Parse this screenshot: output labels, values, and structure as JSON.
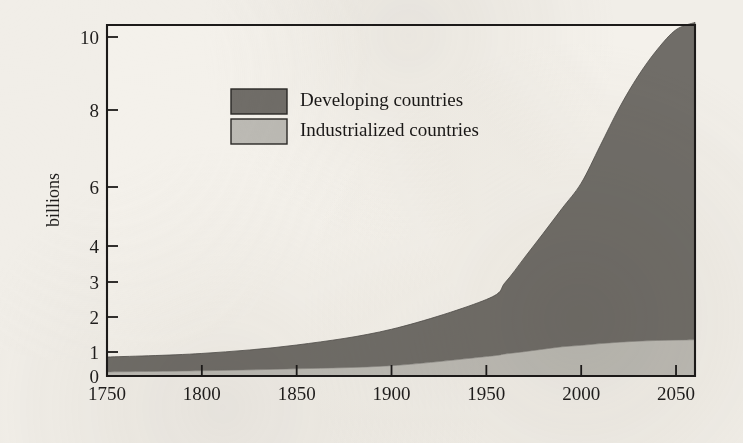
{
  "figure": {
    "background_color": "#f1eee8",
    "ink_color": "#1c1a19"
  },
  "axes": {
    "y_title": "billions",
    "y_tick_labels": [
      "0",
      "1",
      "2",
      "3",
      "4",
      "6",
      "8",
      "10"
    ],
    "x_tick_labels": [
      "1750",
      "1800",
      "1850",
      "1900",
      "1950",
      "2000",
      "2050"
    ]
  },
  "legend": {
    "entries": [
      {
        "label": "Developing countries",
        "color": "#706d68",
        "swatch_name": "legend-swatch-developing"
      },
      {
        "label": "Industrialized countries",
        "color": "#bcbab4",
        "swatch_name": "legend-swatch-industrialized"
      }
    ]
  },
  "chart_data": {
    "type": "area",
    "title": "",
    "subtitle": "",
    "xlabel": "",
    "ylabel": "billions",
    "stacked": true,
    "grid": false,
    "legend_position": "inside-upper-left",
    "xlim": [
      1750,
      2060
    ],
    "ylim": [
      0,
      10.6
    ],
    "y_axis_scale": "piecewise-linear (compressed above 4)",
    "y_ticks": [
      0,
      1,
      2,
      3,
      4,
      6,
      8,
      10
    ],
    "x_ticks": [
      1750,
      1800,
      1850,
      1900,
      1950,
      2000,
      2050
    ],
    "x": [
      1750,
      1800,
      1850,
      1900,
      1950,
      1960,
      1970,
      1980,
      1990,
      2000,
      2010,
      2020,
      2030,
      2040,
      2050,
      2060
    ],
    "series": [
      {
        "name": "Industrialized countries",
        "color": "#bcbab4",
        "values": [
          0.17,
          0.22,
          0.3,
          0.43,
          0.81,
          0.92,
          1.01,
          1.08,
          1.15,
          1.19,
          1.24,
          1.28,
          1.31,
          1.33,
          1.34,
          1.35
        ]
      },
      {
        "name": "Developing countries",
        "color": "#706d68",
        "values": [
          0.62,
          0.72,
          0.9,
          1.22,
          1.69,
          2.07,
          2.66,
          3.35,
          4.13,
          4.91,
          5.83,
          6.77,
          7.62,
          8.32,
          8.86,
          9.05
        ]
      }
    ],
    "totals": [
      0.79,
      0.94,
      1.2,
      1.65,
      2.5,
      2.99,
      3.67,
      4.43,
      5.28,
      6.1,
      7.07,
      8.05,
      8.93,
      9.65,
      10.2,
      10.4
    ]
  }
}
